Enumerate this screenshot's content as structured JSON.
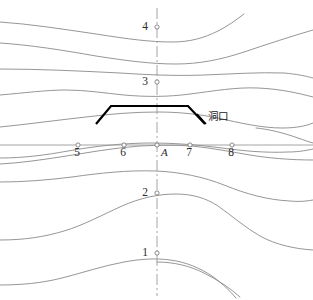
{
  "figure": {
    "title": "",
    "width": 313,
    "height": 300,
    "background": "#ffffff",
    "contour_color": "#8a8a8a",
    "axis_color": "#9a9a9a",
    "tunnel_color": "#000000"
  },
  "labels": {
    "tunnel_entrance": "洞口",
    "center_point": "A"
  },
  "horizontal_axis": {
    "ticks": [
      {
        "label": "5",
        "x": 78,
        "y": 145
      },
      {
        "label": "6",
        "x": 124,
        "y": 145
      },
      {
        "label": "A",
        "x": 157,
        "y": 145
      },
      {
        "label": "7",
        "x": 190,
        "y": 145
      },
      {
        "label": "8",
        "x": 232,
        "y": 145
      }
    ]
  },
  "vertical_axis": {
    "ticks": [
      {
        "label": "4",
        "x": 157,
        "y": 27
      },
      {
        "label": "3",
        "x": 157,
        "y": 82
      },
      {
        "label": "2",
        "x": 157,
        "y": 193
      },
      {
        "label": "1",
        "x": 157,
        "y": 253
      }
    ]
  },
  "chart_data": {
    "type": "line",
    "title": "",
    "xlabel": "",
    "ylabel": "",
    "grid": false,
    "legend": "none",
    "xlim": [
      0,
      313
    ],
    "ylim": [
      0,
      300
    ],
    "axes": [
      {
        "name": "horizontal-section-line",
        "style": "solid",
        "path": "M 0 145 L 313 145"
      },
      {
        "name": "vertical-centerline",
        "style": "dash-dot",
        "path": "M 157 8 L 157 296"
      }
    ],
    "tunnel_portal": {
      "name": "tunnel-portal-outline",
      "style": "heavy-solid",
      "points": [
        [
          96,
          124
        ],
        [
          111,
          106
        ],
        [
          188,
          106
        ],
        [
          205,
          124
        ]
      ]
    },
    "leader_line": {
      "name": "tunnel-label-leader",
      "points": [
        [
          197,
          114
        ],
        [
          206,
          124
        ]
      ]
    },
    "contours": [
      {
        "id": "c1",
        "path": "M 0 22 C 30 24 62 29 96 34 C 128 39 150 42 172 42 C 190 42 204 38 218 31 C 228 26 236 20 244 14"
      },
      {
        "id": "c2",
        "path": "M 0 43 C 30 45 62 50 96 56 C 128 61 152 64 176 64 C 198 64 220 60 244 52 C 268 44 292 36 313 30"
      },
      {
        "id": "c3",
        "path": "M 0 69 C 40 69 80 71 120 73 C 150 75 178 76 204 75 C 232 74 258 72 284 73 C 296 74 306 76 313 78"
      },
      {
        "id": "c4",
        "path": "M 0 95 C 24 93 46 90 66 90 C 86 90 104 93 124 95 C 146 97 168 97 190 94 C 214 91 236 87 258 88 C 280 89 298 93 313 97"
      },
      {
        "id": "c5",
        "path": "M 0 127 C 30 124 58 120 86 117 C 110 114 134 112 158 112 C 178 112 198 114 218 118 C 240 123 262 128 282 128 C 296 128 306 126 313 123"
      },
      {
        "id": "c6",
        "path": "M 256 128 C 268 129 284 133 298 138 C 304 140 309 142 313 143"
      },
      {
        "id": "c7",
        "path": "M 0 164 C 20 163 40 160 60 157 C 86 153 112 148 140 146 C 158 145 176 145 192 146 C 212 148 232 152 250 155 C 268 158 290 160 313 160"
      },
      {
        "id": "c8",
        "path": "M 0 158 C 24 158 46 155 68 151 C 96 146 124 143 152 143 C 176 143 200 145 222 148 C 244 151 266 153 288 152 C 300 152 308 150 313 149"
      },
      {
        "id": "c9",
        "path": "M 0 182 C 24 182 48 180 72 177 C 100 173 128 170 156 171 C 180 172 204 177 224 185 C 246 194 268 200 290 201 C 300 202 307 201 313 200"
      },
      {
        "id": "c10",
        "path": "M 0 240 C 24 240 44 237 64 231 C 84 225 102 215 122 206 C 140 198 158 194 176 194 C 192 194 206 198 218 206 C 232 216 246 228 260 236 C 276 245 296 249 313 250"
      },
      {
        "id": "c11",
        "path": "M 0 285 C 22 285 42 283 62 278 C 82 273 102 266 124 262 C 140 259 156 258 170 260 C 186 262 200 268 212 276 C 222 283 230 291 236 298"
      },
      {
        "id": "c12",
        "path": "M 157 262 C 174 262 190 266 204 273 C 218 280 230 288 240 297"
      }
    ],
    "station_markers": [
      {
        "label": "4",
        "x": 157,
        "y": 27
      },
      {
        "label": "3",
        "x": 157,
        "y": 82
      },
      {
        "label": "A",
        "x": 157,
        "y": 145
      },
      {
        "label": "2",
        "x": 157,
        "y": 193
      },
      {
        "label": "1",
        "x": 157,
        "y": 253
      },
      {
        "label": "5",
        "x": 78,
        "y": 145
      },
      {
        "label": "6",
        "x": 124,
        "y": 145
      },
      {
        "label": "7",
        "x": 190,
        "y": 145
      },
      {
        "label": "8",
        "x": 232,
        "y": 145
      }
    ]
  }
}
